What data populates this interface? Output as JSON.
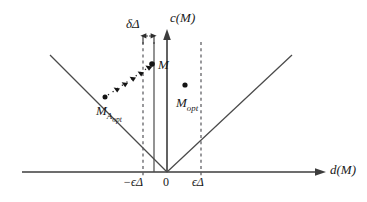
{
  "figure": {
    "axes": {
      "y_label": "c(M)",
      "x_label": "d(M)",
      "origin_label": "0"
    },
    "ticks": [
      {
        "name": "neg-epsilon-delta",
        "label": "−ϵΔ",
        "x": 143
      },
      {
        "name": "origin",
        "label": "0",
        "x": 167
      },
      {
        "name": "epsilon-delta",
        "label": "ϵΔ",
        "x": 201
      }
    ],
    "annotations": {
      "gap_label": "δΔ",
      "point_M": "M",
      "point_M_A_opt_base": "M",
      "point_M_A_opt_sub": "A",
      "point_M_A_opt_subsub": "opt",
      "point_M_opt_base": "M",
      "point_M_opt_sub": "opt"
    },
    "colors": {
      "line": "#3c3c3c",
      "dashed": "#55555a",
      "point": "#141414",
      "background": "#ffffff"
    }
  }
}
